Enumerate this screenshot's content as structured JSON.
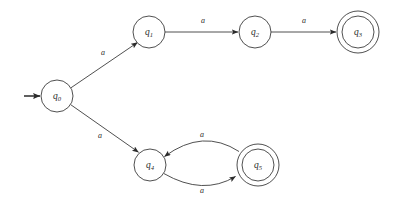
{
  "diagram": {
    "type": "finite-state-automaton",
    "title": "",
    "background_color": "#ffffff",
    "stroke_color": "#3c3c3c",
    "text_color": "#2b2b2b",
    "alphabet": [
      "a"
    ],
    "start_state": "q0",
    "accepting_states": [
      "q3",
      "q5"
    ],
    "states": [
      {
        "id": "q0",
        "label_base": "q",
        "label_sub": "0",
        "cx": 57,
        "cy": 96,
        "r": 16,
        "accepting": false,
        "start": true
      },
      {
        "id": "q1",
        "label_base": "q",
        "label_sub": "1",
        "cx": 149,
        "cy": 32,
        "r": 16,
        "accepting": false,
        "start": false
      },
      {
        "id": "q2",
        "label_base": "q",
        "label_sub": "2",
        "cx": 255,
        "cy": 32,
        "r": 16,
        "accepting": false,
        "start": false
      },
      {
        "id": "q3",
        "label_base": "q",
        "label_sub": "3",
        "cx": 358,
        "cy": 32,
        "r": 16,
        "r_outer": 21,
        "accepting": true,
        "start": false
      },
      {
        "id": "q4",
        "label_base": "q",
        "label_sub": "4",
        "cx": 150,
        "cy": 165,
        "r": 16,
        "accepting": false,
        "start": false
      },
      {
        "id": "q5",
        "label_base": "q",
        "label_sub": "5",
        "cx": 258,
        "cy": 165,
        "r": 16,
        "r_outer": 21,
        "accepting": true,
        "start": false
      }
    ],
    "transitions": [
      {
        "id": "t-q0-q1",
        "from": "q0",
        "to": "q1",
        "symbol": "a",
        "shape": "straight",
        "label_x": 103,
        "label_y": 53
      },
      {
        "id": "t-q1-q2",
        "from": "q1",
        "to": "q2",
        "symbol": "a",
        "shape": "straight",
        "label_x": 203,
        "label_y": 21
      },
      {
        "id": "t-q2-q3",
        "from": "q2",
        "to": "q3",
        "symbol": "a",
        "shape": "straight",
        "label_x": 304,
        "label_y": 21
      },
      {
        "id": "t-q0-q4",
        "from": "q0",
        "to": "q4",
        "symbol": "a",
        "shape": "straight",
        "label_x": 100,
        "label_y": 136
      },
      {
        "id": "t-q4-q5",
        "from": "q4",
        "to": "q5",
        "symbol": "a",
        "shape": "curve-down",
        "label_x": 202,
        "label_y": 191
      },
      {
        "id": "t-q5-q4",
        "from": "q5",
        "to": "q4",
        "symbol": "a",
        "shape": "curve-up",
        "label_x": 202,
        "label_y": 135
      }
    ],
    "start_marker": {
      "id": "start-arrow",
      "x1": 24,
      "y1": 96,
      "x2": 41,
      "y2": 96
    }
  }
}
